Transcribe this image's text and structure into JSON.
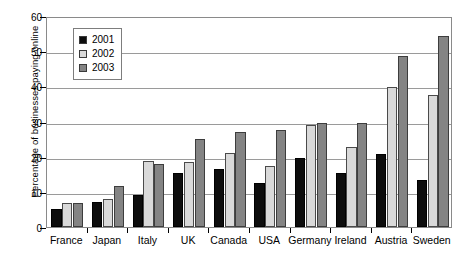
{
  "chart_data": {
    "type": "bar",
    "title": "",
    "xlabel": "",
    "ylabel": "Percentage of businesses paying online",
    "ylim": [
      0,
      60
    ],
    "ytick_values": [
      0,
      10,
      20,
      30,
      40,
      50,
      60
    ],
    "ytick_labels": [
      "0",
      "10",
      "20",
      "30",
      "40",
      "50",
      "60"
    ],
    "grid": true,
    "legend_position": "upper-left-inside",
    "categories": [
      "France",
      "Japan",
      "Italy",
      "UK",
      "Canada",
      "USA",
      "Germany",
      "Ireland",
      "Austria",
      "Sweden"
    ],
    "series": [
      {
        "name": "2001",
        "color": "#0d0d0d",
        "values": [
          5.2,
          7.2,
          9.0,
          15.5,
          16.6,
          12.5,
          19.5,
          15.4,
          20.7,
          13.4
        ]
      },
      {
        "name": "2002",
        "color": "#d9d9d9",
        "values": [
          6.9,
          8.1,
          18.8,
          18.5,
          21.0,
          17.4,
          29.0,
          22.8,
          39.8,
          37.4
        ]
      },
      {
        "name": "2003",
        "color": "#848484",
        "values": [
          6.9,
          11.8,
          18.0,
          24.9,
          26.9,
          27.7,
          29.5,
          29.5,
          48.5,
          54.3
        ]
      }
    ]
  },
  "legend": {
    "entries": [
      {
        "label": "2001",
        "swatch": "legend-swatch-2001"
      },
      {
        "label": "2002",
        "swatch": "legend-swatch-2002"
      },
      {
        "label": "2003",
        "swatch": "legend-swatch-2003"
      }
    ]
  },
  "colors": {
    "series_2001": "#0d0d0d",
    "series_2002": "#d9d9d9",
    "series_2003": "#848484",
    "gridline": "#9a9a9a",
    "axis": "#000000",
    "plot_border": "#8a8a8a",
    "background": "#ffffff"
  }
}
